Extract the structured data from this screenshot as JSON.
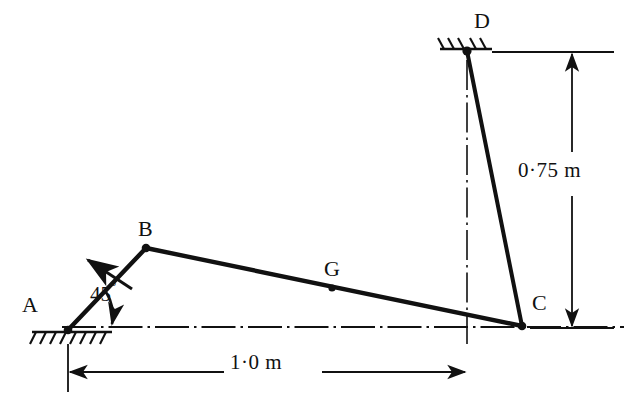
{
  "figure": {
    "type": "mechanism-diagram",
    "background_color": "#ffffff",
    "line_color": "#111111",
    "width": 639,
    "height": 420
  },
  "points": [
    {
      "id": "A",
      "label": "A",
      "label_x": 22,
      "label_y": 298,
      "x": 68,
      "y": 330,
      "kind": "fixed-pivot-ground"
    },
    {
      "id": "B",
      "label": "B",
      "label_x": 138,
      "label_y": 222,
      "x": 146,
      "y": 248,
      "kind": "pin-joint"
    },
    {
      "id": "G",
      "label": "G",
      "label_x": 324,
      "label_y": 262,
      "x": 332,
      "y": 288,
      "kind": "centre-of-mass"
    },
    {
      "id": "C",
      "label": "C",
      "label_x": 532,
      "label_y": 296,
      "x": 522,
      "y": 326,
      "kind": "pin-joint"
    },
    {
      "id": "D",
      "label": "D",
      "label_x": 474,
      "label_y": 14,
      "x": 467,
      "y": 51,
      "kind": "fixed-pivot-ground"
    }
  ],
  "links": [
    {
      "id": "AB",
      "from": "A",
      "to": "B",
      "label": ""
    },
    {
      "id": "BC",
      "from": "B",
      "to": "C",
      "label": ""
    },
    {
      "id": "DC",
      "from": "D",
      "to": "C",
      "label": ""
    }
  ],
  "angle": {
    "label_value": "45",
    "label_unit": "°",
    "label_x": 90,
    "label_y": 286,
    "value_degrees": 45,
    "at_point": "A",
    "between": "ground-line and link AB"
  },
  "dimensions": [
    {
      "id": "horizontal",
      "text": "1·0 m",
      "value": 1.0,
      "unit": "m",
      "label_x": 245,
      "label_y": 353,
      "orientation": "horizontal",
      "from_x": 68,
      "to_x": 467,
      "y": 372
    },
    {
      "id": "vertical",
      "text": "0·75 m",
      "value": 0.75,
      "unit": "m",
      "label_x": 521,
      "label_y": 165,
      "orientation": "vertical",
      "x": 572,
      "from_y": 52,
      "to_y": 328
    }
  ],
  "arrows": [
    {
      "id": "velocity-arrow-on-AB",
      "description": "short arrow crossing link AB, pointing up-left perpendicular to AB",
      "tail_x": 130,
      "tail_y": 288,
      "tip_x": 86,
      "tip_y": 259
    },
    {
      "id": "angle-arc-arrow",
      "description": "curved arc from link AB down to the ground line at A marking the 45 degree angle",
      "arrowhead_at": "ground-line"
    }
  ],
  "centrelines": [
    {
      "id": "horizontal-datum",
      "orientation": "horizontal",
      "y": 327,
      "from_x": 60,
      "to_x": 624
    },
    {
      "id": "vertical-through-D",
      "orientation": "vertical",
      "x": 467,
      "from_y": 52,
      "to_y": 344
    }
  ],
  "supports": [
    {
      "id": "ground-hatch-A",
      "at_point": "A",
      "style": "hatched-ground-below",
      "x": 68,
      "y": 332
    },
    {
      "id": "ground-hatch-D",
      "at_point": "D",
      "style": "hatched-ground-above-left",
      "x": 467,
      "y": 48
    }
  ]
}
